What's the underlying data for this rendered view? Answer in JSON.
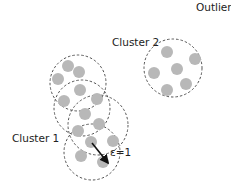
{
  "labels": {
    "outlier": "Outlier",
    "cluster2": "Cluster 2",
    "cluster1": "Cluster 1",
    "epsilon": "ε=1"
  },
  "colors": {
    "point": "#b8b8b8",
    "dashed_circle": "#555555",
    "arrow": "#111111",
    "text": "#222222"
  },
  "cluster1": {
    "neighborhoods": [
      {
        "cx": 78,
        "cy": 83,
        "r": 28
      },
      {
        "cx": 82,
        "cy": 108,
        "r": 28
      },
      {
        "cx": 98,
        "cy": 125,
        "r": 30
      },
      {
        "cx": 92,
        "cy": 152,
        "r": 28
      }
    ],
    "points": [
      {
        "x": 68,
        "y": 66
      },
      {
        "x": 79,
        "y": 72
      },
      {
        "x": 58,
        "y": 79
      },
      {
        "x": 80,
        "y": 90
      },
      {
        "x": 64,
        "y": 101
      },
      {
        "x": 97,
        "y": 99
      },
      {
        "x": 85,
        "y": 114
      },
      {
        "x": 99,
        "y": 124
      },
      {
        "x": 78,
        "y": 131
      },
      {
        "x": 91,
        "y": 142
      },
      {
        "x": 113,
        "y": 141
      },
      {
        "x": 81,
        "y": 156
      },
      {
        "x": 103,
        "y": 162
      }
    ],
    "arrow": {
      "x1": 92,
      "y1": 143,
      "x2": 108,
      "y2": 163
    }
  },
  "cluster2": {
    "neighborhood": {
      "cx": 173,
      "cy": 68,
      "r": 29
    },
    "points": [
      {
        "x": 167,
        "y": 52
      },
      {
        "x": 195,
        "y": 59
      },
      {
        "x": 154,
        "y": 73
      },
      {
        "x": 177,
        "y": 69
      },
      {
        "x": 186,
        "y": 84
      },
      {
        "x": 167,
        "y": 90
      }
    ]
  }
}
